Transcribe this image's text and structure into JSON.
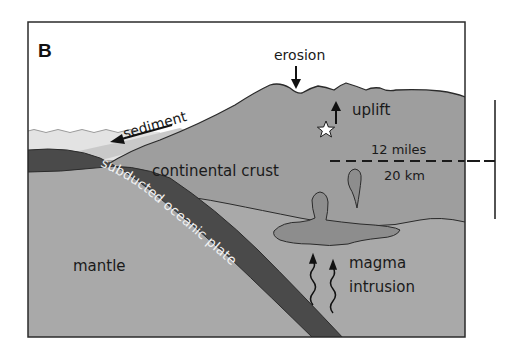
{
  "panel_label": "B",
  "labels": {
    "erosion": "erosion",
    "uplift": "uplift",
    "sediment": "sediment",
    "continental_crust": "continental crust",
    "subducted_plate": "subducted oceanic plate",
    "mantle": "mantle",
    "magma": "magma",
    "intrusion": "intrusion",
    "depth_miles": "12 miles",
    "depth_km": "20 km"
  },
  "colors": {
    "sky": "#ffffff",
    "ocean": "#e3e3e3",
    "sediment": "#c9c9c9",
    "crust": "#9e9e9e",
    "mantle": "#a9a9a9",
    "slab": "#4a4a4a",
    "magma": "#8d8d8d",
    "outline": "#2b2b2b"
  },
  "symbols": {
    "star": "earthquake-star",
    "uplift_arrow": "up-arrow",
    "erosion_arrow": "down-arrow",
    "sediment_arrow": "left-arrow",
    "magma_arrows": "wavy-up-arrows"
  }
}
